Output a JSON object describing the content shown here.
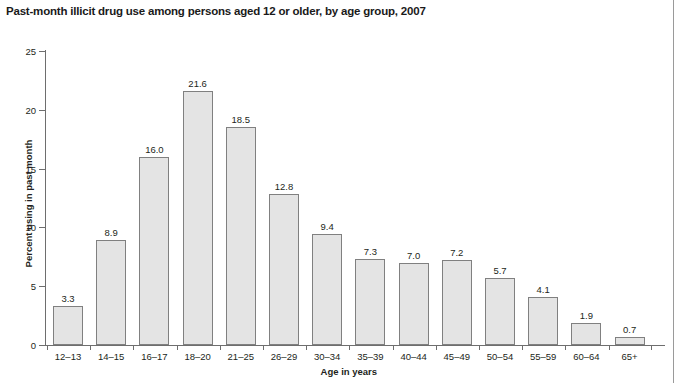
{
  "chart_data": {
    "type": "bar",
    "title": "Past-month illicit drug use among persons aged 12 or older, by age group, 2007",
    "xlabel": "Age in years",
    "ylabel": "Percent using in past month",
    "categories": [
      "12–13",
      "14–15",
      "16–17",
      "18–20",
      "21–25",
      "26–29",
      "30–34",
      "35–39",
      "40–44",
      "45–49",
      "50–54",
      "55–59",
      "60–64",
      "65+"
    ],
    "values": [
      3.3,
      8.9,
      16.0,
      21.6,
      18.5,
      12.8,
      9.4,
      7.3,
      7.0,
      7.2,
      5.7,
      4.1,
      1.9,
      0.7
    ],
    "value_labels": [
      "3.3",
      "8.9",
      "16.0",
      "21.6",
      "18.5",
      "12.8",
      "9.4",
      "7.3",
      "7.0",
      "7.2",
      "5.7",
      "4.1",
      "1.9",
      "0.7"
    ],
    "ylim": [
      0,
      25
    ],
    "yticks": [
      0,
      5,
      10,
      15,
      20,
      25
    ],
    "ytick_labels": [
      "0",
      "5",
      "10",
      "15",
      "20",
      "25"
    ],
    "grid": false,
    "legend": null,
    "bar_fill_color": "#e4e4e4",
    "bar_border_color": "#808080",
    "axis_color": "#6e6e6e",
    "text_color": "#231f20"
  }
}
